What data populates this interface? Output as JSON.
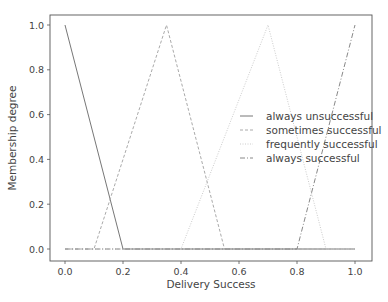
{
  "chart_data": {
    "type": "line",
    "title": "",
    "xlabel": "Delivery Success",
    "ylabel": "Membership degree",
    "xlim": [
      -0.05,
      1.05
    ],
    "ylim": [
      -0.05,
      1.05
    ],
    "xticks": [
      0.0,
      0.2,
      0.4,
      0.6,
      0.8,
      1.0
    ],
    "xtick_labels": [
      "0.0",
      "0.2",
      "0.4",
      "0.6",
      "0.8",
      "1.0"
    ],
    "yticks": [
      0.0,
      0.2,
      0.4,
      0.6,
      0.8,
      1.0
    ],
    "ytick_labels": [
      "0.0",
      "0.2",
      "0.4",
      "0.6",
      "0.8",
      "1.0"
    ],
    "grid": false,
    "legend_position": "center right",
    "series": [
      {
        "name": "always unsuccessful",
        "style": "solid",
        "color": "#777777",
        "x": [
          0.0,
          0.2,
          1.0
        ],
        "y": [
          1.0,
          0.0,
          0.0
        ]
      },
      {
        "name": "sometimes successful",
        "style": "dashed",
        "color": "#aaaaaa",
        "x": [
          0.0,
          0.1,
          0.35,
          0.55,
          1.0
        ],
        "y": [
          0.0,
          0.0,
          1.0,
          0.0,
          0.0
        ]
      },
      {
        "name": "frequently successful",
        "style": "dotted",
        "color": "#cccccc",
        "x": [
          0.0,
          0.4,
          0.7,
          0.9,
          1.0
        ],
        "y": [
          0.0,
          0.0,
          1.0,
          0.0,
          0.0
        ]
      },
      {
        "name": "always successful",
        "style": "dashdot",
        "color": "#888888",
        "x": [
          0.0,
          0.8,
          1.0
        ],
        "y": [
          0.0,
          0.0,
          1.0
        ]
      }
    ]
  },
  "legend": {
    "items": [
      "always unsuccessful",
      "sometimes successful",
      "frequently successful",
      "always successful"
    ]
  }
}
